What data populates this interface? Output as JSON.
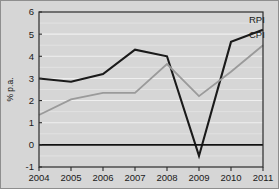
{
  "chart_data": {
    "type": "line",
    "title": "",
    "subtitle": "",
    "xlabel": "",
    "ylabel": "% p.a.",
    "categories": [
      "2004",
      "2005",
      "2006",
      "2007",
      "2008",
      "2009",
      "2010",
      "2011"
    ],
    "x": [
      2004,
      2005,
      2006,
      2007,
      2008,
      2009,
      2010,
      2011
    ],
    "series": [
      {
        "name": "RPI",
        "color": "#1a1a1a",
        "values": [
          3.0,
          2.85,
          3.2,
          4.3,
          4.0,
          -0.5,
          4.65,
          5.2
        ]
      },
      {
        "name": "CPI",
        "color": "#9a9a9a",
        "values": [
          1.35,
          2.05,
          2.35,
          2.35,
          3.65,
          2.2,
          3.3,
          4.5
        ]
      }
    ],
    "ylim": [
      -1,
      6
    ],
    "xlim": [
      2004,
      2011
    ],
    "yticks": [
      -1,
      0,
      1,
      2,
      3,
      4,
      5,
      6
    ],
    "ytick_labels": [
      "-1",
      "0",
      "1",
      "2",
      "3",
      "4",
      "5",
      "6"
    ],
    "xticks": [
      2004,
      2005,
      2006,
      2007,
      2008,
      2009,
      2010,
      2011
    ],
    "grid": true,
    "grid_color": "#efefef",
    "legend_position": "inline-right",
    "annotations": [
      {
        "text": "RPI",
        "series": "RPI"
      },
      {
        "text": "CPI",
        "series": "CPI"
      }
    ],
    "background_color": "#d6d6d6",
    "zero_line": 0
  },
  "figure": {
    "border_color": "#8e8e8e"
  }
}
